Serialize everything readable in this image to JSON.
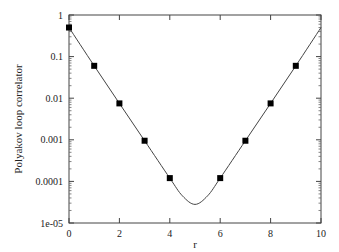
{
  "chart_data": {
    "type": "line",
    "title": "",
    "xlabel": "r",
    "ylabel": "Polyakov loop correlator",
    "yscale": "log",
    "xlim": [
      0,
      10
    ],
    "ylim": [
      1e-05,
      1
    ],
    "x_ticks": [
      "0",
      "2",
      "4",
      "6",
      "8",
      "10"
    ],
    "y_ticks": [
      "1",
      "0.1",
      "0.01",
      "0.001",
      "0.0001",
      "1e-05"
    ],
    "grid": false,
    "legend": null,
    "series": [
      {
        "name": "data",
        "style": "markers",
        "marker": "filled-square",
        "x": [
          0,
          1,
          2,
          3,
          4,
          6,
          7,
          8,
          9
        ],
        "y": [
          0.5,
          0.06,
          0.0075,
          0.00095,
          0.00012,
          0.00012,
          0.00095,
          0.0075,
          0.06
        ]
      },
      {
        "name": "fit",
        "style": "line",
        "x": [
          0,
          1,
          2,
          3,
          4,
          4.5,
          5,
          5.5,
          6,
          7,
          8,
          9,
          10
        ],
        "y": [
          0.5,
          0.06,
          0.0075,
          0.00095,
          0.00012,
          4.5e-05,
          2.8e-05,
          4.5e-05,
          0.00012,
          0.00095,
          0.0075,
          0.06,
          0.5
        ]
      }
    ]
  }
}
